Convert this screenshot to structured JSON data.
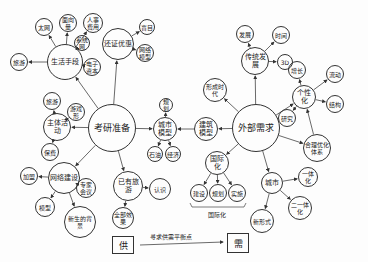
{
  "colors": {
    "ink": "#333333",
    "paper": "#fdfdfd"
  },
  "nodes": [
    {
      "id": "center_left",
      "text": "考研准备",
      "x": 112,
      "y": 128,
      "r": 24,
      "size": "big"
    },
    {
      "id": "center_right",
      "text": "外部需求",
      "x": 256,
      "y": 128,
      "r": 24,
      "size": "big"
    },
    {
      "id": "n1",
      "text": "生活手段",
      "x": 65,
      "y": 62,
      "r": 18,
      "size": "mid"
    },
    {
      "id": "n1a",
      "text": "太网",
      "x": 44,
      "y": 27,
      "r": 9
    },
    {
      "id": "n1b",
      "text": "面向量",
      "x": 68,
      "y": 23,
      "r": 9
    },
    {
      "id": "n1c",
      "text": "人事费用",
      "x": 93,
      "y": 23,
      "r": 10
    },
    {
      "id": "n1d",
      "text": "系统网",
      "x": 82,
      "y": 43,
      "r": 8
    },
    {
      "id": "n1e",
      "text": "电子资本",
      "x": 92,
      "y": 67,
      "r": 9
    },
    {
      "id": "n1f",
      "text": "旅游",
      "x": 19,
      "y": 62,
      "r": 9
    },
    {
      "id": "n2",
      "text": "还证优惠",
      "x": 118,
      "y": 44,
      "r": 16,
      "size": "mid"
    },
    {
      "id": "n2a",
      "text": "盲目",
      "x": 147,
      "y": 27,
      "r": 8
    },
    {
      "id": "n2b",
      "text": "网络模型",
      "x": 145,
      "y": 53,
      "r": 9
    },
    {
      "id": "n3",
      "text": "主体活动",
      "x": 57,
      "y": 127,
      "r": 14,
      "size": "mid"
    },
    {
      "id": "n3a",
      "text": "旅游",
      "x": 52,
      "y": 101,
      "r": 9
    },
    {
      "id": "n3b",
      "text": "游戏形",
      "x": 76,
      "y": 112,
      "r": 9
    },
    {
      "id": "n3c",
      "text": "保费",
      "x": 50,
      "y": 152,
      "r": 9
    },
    {
      "id": "n4",
      "text": "网络建设",
      "x": 64,
      "y": 178,
      "r": 16,
      "size": "mid"
    },
    {
      "id": "n4a",
      "text": "加盟",
      "x": 29,
      "y": 176,
      "r": 9
    },
    {
      "id": "n4b",
      "text": "专家会议",
      "x": 86,
      "y": 188,
      "r": 10
    },
    {
      "id": "n4c",
      "text": "模型",
      "x": 45,
      "y": 207,
      "r": 10
    },
    {
      "id": "n4d",
      "text": "新生的背景",
      "x": 80,
      "y": 222,
      "r": 16
    },
    {
      "id": "n5",
      "text": "已有旅游",
      "x": 128,
      "y": 186,
      "r": 15,
      "size": "mid"
    },
    {
      "id": "n5a",
      "text": "认识",
      "x": 160,
      "y": 189,
      "r": 11
    },
    {
      "id": "n5b",
      "text": "全部效果",
      "x": 123,
      "y": 218,
      "r": 11
    },
    {
      "id": "n6",
      "text": "城市模型",
      "x": 165,
      "y": 129,
      "r": 12,
      "size": "mid"
    },
    {
      "id": "n6a",
      "text": "规划",
      "x": 166,
      "y": 105,
      "r": 7
    },
    {
      "id": "n6b",
      "text": "石油",
      "x": 155,
      "y": 154,
      "r": 8
    },
    {
      "id": "n6c",
      "text": "经济",
      "x": 173,
      "y": 154,
      "r": 8
    },
    {
      "id": "n7",
      "text": "建筑模型",
      "x": 206,
      "y": 129,
      "r": 12,
      "size": "mid"
    },
    {
      "id": "n8",
      "text": "形成时代",
      "x": 215,
      "y": 90,
      "r": 12
    },
    {
      "id": "n9",
      "text": "传统发展",
      "x": 255,
      "y": 61,
      "r": 14,
      "size": "mid"
    },
    {
      "id": "n9a",
      "text": "发展",
      "x": 245,
      "y": 34,
      "r": 9
    },
    {
      "id": "n9b",
      "text": "时间",
      "x": 281,
      "y": 35,
      "r": 9
    },
    {
      "id": "n9c",
      "text": "3D",
      "x": 285,
      "y": 62,
      "r": 8
    },
    {
      "id": "n10",
      "text": "个性化",
      "x": 304,
      "y": 97,
      "r": 12,
      "size": "mid"
    },
    {
      "id": "n10a",
      "text": "增长",
      "x": 297,
      "y": 70,
      "r": 9
    },
    {
      "id": "n10b",
      "text": "流动",
      "x": 335,
      "y": 74,
      "r": 9
    },
    {
      "id": "n10c",
      "text": "结构",
      "x": 335,
      "y": 104,
      "r": 9
    },
    {
      "id": "n10d",
      "text": "研究",
      "x": 287,
      "y": 118,
      "r": 9
    },
    {
      "id": "n11",
      "text": "合理优化体系",
      "x": 317,
      "y": 148,
      "r": 14
    },
    {
      "id": "n12",
      "text": "国际化",
      "x": 217,
      "y": 163,
      "r": 12,
      "size": "mid"
    },
    {
      "id": "n12a",
      "text": "建设",
      "x": 199,
      "y": 193,
      "r": 9
    },
    {
      "id": "n12b",
      "text": "规划",
      "x": 218,
      "y": 193,
      "r": 9
    },
    {
      "id": "n12c",
      "text": "实施",
      "x": 237,
      "y": 193,
      "r": 9
    },
    {
      "id": "n13",
      "text": "城市",
      "x": 272,
      "y": 183,
      "r": 11,
      "size": "mid"
    },
    {
      "id": "n13a",
      "text": "一体化",
      "x": 308,
      "y": 177,
      "r": 10
    },
    {
      "id": "n13b",
      "text": "二一体化",
      "x": 300,
      "y": 208,
      "r": 12
    },
    {
      "id": "n13c",
      "text": "新形式",
      "x": 262,
      "y": 221,
      "r": 12
    }
  ],
  "edges": [
    [
      "center_left",
      "n1"
    ],
    [
      "center_left",
      "n2"
    ],
    [
      "center_left",
      "n3"
    ],
    [
      "center_left",
      "n4"
    ],
    [
      "center_left",
      "n5"
    ],
    [
      "center_left",
      "n6"
    ],
    [
      "n1",
      "n1a"
    ],
    [
      "n1",
      "n1b"
    ],
    [
      "n1",
      "n1c"
    ],
    [
      "n1",
      "n1d"
    ],
    [
      "n1",
      "n1e"
    ],
    [
      "n1",
      "n1f"
    ],
    [
      "n2",
      "n2a"
    ],
    [
      "n2",
      "n2b"
    ],
    [
      "n3",
      "n3a"
    ],
    [
      "n3",
      "n3b"
    ],
    [
      "n3",
      "n3c"
    ],
    [
      "n4",
      "n4a"
    ],
    [
      "n4",
      "n4b"
    ],
    [
      "n4",
      "n4c"
    ],
    [
      "n4",
      "n4d"
    ],
    [
      "n5",
      "n5a"
    ],
    [
      "n5",
      "n5b"
    ],
    [
      "n6",
      "n6a"
    ],
    [
      "n6",
      "n6b"
    ],
    [
      "n6",
      "n6c"
    ],
    [
      "n7",
      "n6"
    ],
    [
      "center_right",
      "n7"
    ],
    [
      "center_right",
      "n8"
    ],
    [
      "center_right",
      "n9"
    ],
    [
      "center_right",
      "n10"
    ],
    [
      "center_right",
      "n11"
    ],
    [
      "center_right",
      "n12"
    ],
    [
      "center_right",
      "n13"
    ],
    [
      "n9",
      "n9a"
    ],
    [
      "n9",
      "n9b"
    ],
    [
      "n9",
      "n9c"
    ],
    [
      "n10",
      "n10a"
    ],
    [
      "n10",
      "n10b"
    ],
    [
      "n10",
      "n10c"
    ],
    [
      "n10",
      "n10d"
    ],
    [
      "n11",
      "n10"
    ],
    [
      "n12",
      "n12a"
    ],
    [
      "n12",
      "n12b"
    ],
    [
      "n12",
      "n12c"
    ],
    [
      "n13",
      "n13a"
    ],
    [
      "n13",
      "n13b"
    ],
    [
      "n13",
      "n13c"
    ]
  ],
  "group_label": {
    "text": "国际化",
    "x": 218,
    "y": 210
  },
  "footer": {
    "left_box": {
      "text": "供",
      "x": 112,
      "y": 236,
      "w": 20,
      "h": 16
    },
    "right_box": {
      "text": "需",
      "x": 227,
      "y": 233,
      "w": 20,
      "h": 18
    },
    "arrow_label": "寻求供需平衡点"
  }
}
